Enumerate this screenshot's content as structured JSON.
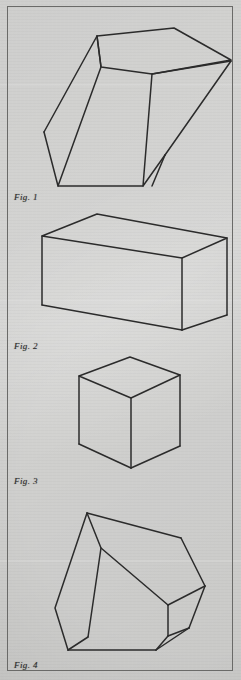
{
  "page": {
    "kind": "scanned-figure-sheet",
    "background_color": "#c9c9c7",
    "ink_color": "#2b2b2b",
    "border_color": "#6a6a68",
    "figure_count": 4
  },
  "figures": [
    {
      "id": "figure-1",
      "caption_prefix": "Fig.",
      "caption_number": "1",
      "caption_text": "Fig. 1",
      "shape": "tilted-hexagonal-prism",
      "description": "Oblique open-topped hexagonal prism tilted to the left",
      "caption_x": 14,
      "caption_y": 192,
      "outline": [
        [
          97,
          36
        ],
        [
          174,
          28
        ],
        [
          231,
          60
        ],
        [
          231,
          61
        ],
        [
          152,
          74
        ],
        [
          101,
          67
        ]
      ],
      "strokes": [
        {
          "name": "top-face",
          "points": [
            [
              97,
              36
            ],
            [
              174,
              28
            ],
            [
              231,
              60
            ],
            [
              152,
              74
            ],
            [
              101,
              67
            ]
          ],
          "closed": true
        },
        {
          "name": "left-body",
          "points": [
            [
              97,
              36
            ],
            [
              101,
              67
            ],
            [
              58,
              186
            ],
            [
              44,
              132
            ]
          ],
          "closed": false
        },
        {
          "name": "left-back-edge",
          "points": [
            [
              44,
              132
            ],
            [
              97,
              36
            ]
          ],
          "closed": false
        },
        {
          "name": "front-floor",
          "points": [
            [
              58,
              186
            ],
            [
              143,
              186
            ]
          ],
          "closed": false
        },
        {
          "name": "right-body",
          "points": [
            [
              152,
              74
            ],
            [
              143,
              186
            ],
            [
              165,
              155
            ]
          ],
          "closed": false
        },
        {
          "name": "right-back-edge",
          "points": [
            [
              165,
              155
            ],
            [
              231,
              61
            ]
          ],
          "closed": false
        },
        {
          "name": "right-inner-edge",
          "points": [
            [
              231,
              61
            ],
            [
              152,
              74
            ]
          ],
          "closed": false
        },
        {
          "name": "right-lower-edge",
          "points": [
            [
              165,
              155
            ],
            [
              152,
              186
            ]
          ],
          "closed": false
        }
      ]
    },
    {
      "id": "figure-2",
      "caption_prefix": "Fig.",
      "caption_number": "2",
      "caption_text": "Fig. 2",
      "shape": "rectangular-box",
      "description": "Rectangular cuboid in three-quarter view",
      "caption_x": 14,
      "caption_y": 341,
      "strokes": [
        {
          "name": "top-face",
          "points": [
            [
              42,
              236
            ],
            [
              97,
              214
            ],
            [
              227,
              238
            ],
            [
              182,
              258
            ]
          ],
          "closed": true
        },
        {
          "name": "left-vertical",
          "points": [
            [
              42,
              236
            ],
            [
              42,
              305
            ]
          ],
          "closed": false
        },
        {
          "name": "front-vertical",
          "points": [
            [
              182,
              258
            ],
            [
              182,
              330
            ]
          ],
          "closed": false
        },
        {
          "name": "right-vertical",
          "points": [
            [
              227,
              238
            ],
            [
              227,
              315
            ]
          ],
          "closed": false
        },
        {
          "name": "bottom-left-edge",
          "points": [
            [
              42,
              305
            ],
            [
              182,
              330
            ]
          ],
          "closed": false
        },
        {
          "name": "bottom-right-edge",
          "points": [
            [
              182,
              330
            ],
            [
              227,
              315
            ]
          ],
          "closed": false
        }
      ]
    },
    {
      "id": "figure-3",
      "caption_prefix": "Fig.",
      "caption_number": "3",
      "caption_text": "Fig. 3",
      "shape": "cube",
      "description": "Cube in isometric three-quarter view",
      "caption_x": 14,
      "caption_y": 476,
      "strokes": [
        {
          "name": "top-face",
          "points": [
            [
              79,
              376
            ],
            [
              130,
              357
            ],
            [
              180,
              375
            ],
            [
              131,
              398
            ]
          ],
          "closed": true
        },
        {
          "name": "left-vertical",
          "points": [
            [
              79,
              376
            ],
            [
              79,
              444
            ]
          ],
          "closed": false
        },
        {
          "name": "front-vertical",
          "points": [
            [
              131,
              398
            ],
            [
              131,
              468
            ]
          ],
          "closed": false
        },
        {
          "name": "right-vertical",
          "points": [
            [
              180,
              375
            ],
            [
              180,
              446
            ]
          ],
          "closed": false
        },
        {
          "name": "bottom-left-edge",
          "points": [
            [
              79,
              444
            ],
            [
              131,
              468
            ]
          ],
          "closed": false
        },
        {
          "name": "bottom-right-edge",
          "points": [
            [
              131,
              468
            ],
            [
              180,
              446
            ]
          ],
          "closed": false
        }
      ]
    },
    {
      "id": "figure-4",
      "caption_prefix": "Fig.",
      "caption_number": "4",
      "caption_text": "Fig. 4",
      "shape": "irregular-polyhedron",
      "description": "Irregular faceted solid, wedge-like, tipped forward",
      "caption_x": 14,
      "caption_y": 660,
      "strokes": [
        {
          "name": "outer-left",
          "points": [
            [
              87,
              513
            ],
            [
              55,
              608
            ],
            [
              68,
              650
            ]
          ],
          "closed": false
        },
        {
          "name": "bottom-edge",
          "points": [
            [
              68,
              650
            ],
            [
              156,
              650
            ]
          ],
          "closed": false
        },
        {
          "name": "upper-right-edge",
          "points": [
            [
              87,
              513
            ],
            [
              181,
              538
            ]
          ],
          "closed": false
        },
        {
          "name": "right-upper-slope",
          "points": [
            [
              181,
              538
            ],
            [
              205,
              586
            ]
          ],
          "closed": false
        },
        {
          "name": "right-lower-slope",
          "points": [
            [
              205,
              586
            ],
            [
              189,
              628
            ]
          ],
          "closed": false
        },
        {
          "name": "right-to-bottom",
          "points": [
            [
              189,
              628
            ],
            [
              156,
              650
            ]
          ],
          "closed": false
        },
        {
          "name": "inner-ridge",
          "points": [
            [
              87,
              513
            ],
            [
              101,
              548
            ],
            [
              88,
              637
            ]
          ],
          "closed": false
        },
        {
          "name": "inner-face-top",
          "points": [
            [
              101,
              548
            ],
            [
              168,
              605
            ]
          ],
          "closed": false
        },
        {
          "name": "inner-face-right",
          "points": [
            [
              168,
              605
            ],
            [
              205,
              586
            ]
          ],
          "closed": false
        },
        {
          "name": "inner-face-lower",
          "points": [
            [
              168,
              605
            ],
            [
              168,
              636
            ]
          ],
          "closed": false
        },
        {
          "name": "inner-face-bottom",
          "points": [
            [
              168,
              636
            ],
            [
              189,
              628
            ]
          ],
          "closed": false
        },
        {
          "name": "front-bottom-left",
          "points": [
            [
              88,
              637
            ],
            [
              68,
              650
            ]
          ],
          "closed": false
        },
        {
          "name": "front-bottom-right",
          "points": [
            [
              168,
              636
            ],
            [
              156,
              650
            ]
          ],
          "closed": false
        }
      ]
    }
  ]
}
